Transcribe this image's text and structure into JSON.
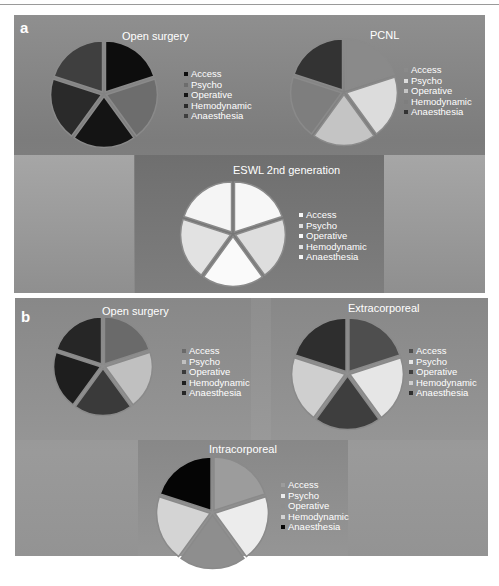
{
  "figure": {
    "panels": [
      {
        "letter": "a"
      },
      {
        "letter": "b"
      }
    ]
  },
  "chart_data": [
    {
      "type": "pie",
      "panel": "a",
      "title": "Open surgery",
      "categories": [
        "Access",
        "Psycho",
        "Operative",
        "Hemodynamic",
        "Anaesthesia"
      ],
      "values": [
        20,
        20,
        20,
        20,
        20
      ],
      "colors": [
        "#0d0d0d",
        "#6d6d6d",
        "#141414",
        "#2a2a2a",
        "#3f3f3f"
      ],
      "legend_position": "right",
      "exploded": true
    },
    {
      "type": "pie",
      "panel": "a",
      "title": "PCNL",
      "categories": [
        "Access",
        "Psycho",
        "Operative",
        "Hemodynamic",
        "Anaesthesia"
      ],
      "values": [
        20,
        20,
        20,
        20,
        20
      ],
      "colors": [
        "#8a8a8a",
        "#dcdcdc",
        "#c4c4c4",
        "#7e7e7e",
        "#333333"
      ],
      "legend_position": "right",
      "exploded": true
    },
    {
      "type": "pie",
      "panel": "a",
      "title": "ESWL 2nd generation",
      "categories": [
        "Access",
        "Psycho",
        "Operative",
        "Hemodynamic",
        "Anaesthesia"
      ],
      "values": [
        20,
        20,
        20,
        20,
        20
      ],
      "colors": [
        "#f7f7f7",
        "#dedede",
        "#fafafa",
        "#e2e2e2",
        "#f5f5f5"
      ],
      "legend_position": "right",
      "exploded": true
    },
    {
      "type": "pie",
      "panel": "b",
      "title": "Open surgery",
      "categories": [
        "Access",
        "Psycho",
        "Operative",
        "Hemodynamic",
        "Anaesthesia"
      ],
      "values": [
        20,
        20,
        20,
        20,
        20
      ],
      "colors": [
        "#6a6a6a",
        "#c0c0c0",
        "#3a3a3a",
        "#1e1e1e",
        "#262626"
      ],
      "legend_position": "right",
      "exploded": true
    },
    {
      "type": "pie",
      "panel": "b",
      "title": "Extracorporeal",
      "categories": [
        "Access",
        "Psycho",
        "Operative",
        "Hemodynamic",
        "Anaesthesia"
      ],
      "values": [
        20,
        20,
        20,
        20,
        20
      ],
      "colors": [
        "#4e4e4e",
        "#e6e6e6",
        "#3e3e3e",
        "#cfcfcf",
        "#2e2e2e"
      ],
      "legend_position": "right",
      "exploded": true
    },
    {
      "type": "pie",
      "panel": "b",
      "title": "Intracorporeal",
      "categories": [
        "Access",
        "Psycho",
        "Operative",
        "Hemodynamic",
        "Anaesthesia"
      ],
      "values": [
        20,
        20,
        20,
        20,
        20
      ],
      "colors": [
        "#9c9c9c",
        "#ececec",
        "#8e8e8e",
        "#d4d4d4",
        "#050505"
      ],
      "legend_position": "right",
      "exploded": true
    }
  ]
}
